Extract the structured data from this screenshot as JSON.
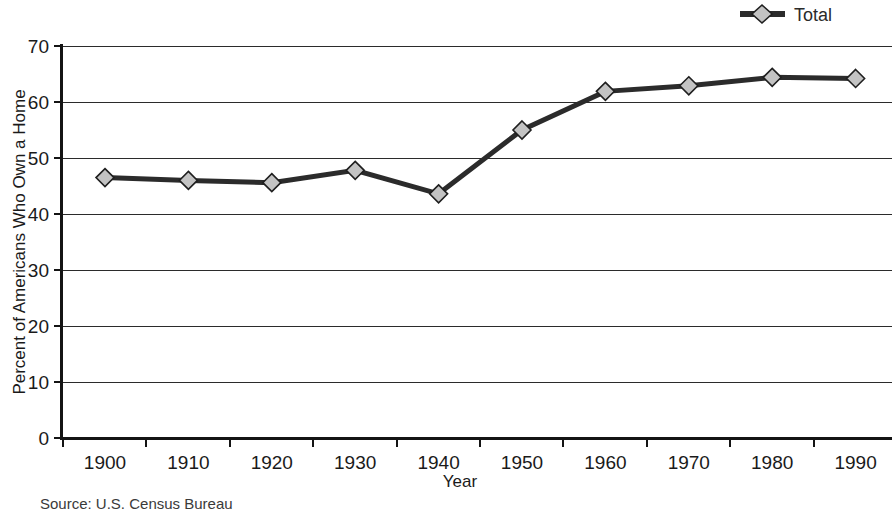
{
  "chart_data": {
    "type": "line",
    "title": "",
    "xlabel": "Year",
    "ylabel": "Percent of Americans Who Own a Home",
    "categories": [
      "1900",
      "1910",
      "1920",
      "1930",
      "1940",
      "1950",
      "1960",
      "1970",
      "1980",
      "1990"
    ],
    "x": [
      1900,
      1910,
      1920,
      1930,
      1940,
      1950,
      1960,
      1970,
      1980,
      1990
    ],
    "series": [
      {
        "name": "Total",
        "values": [
          46.5,
          46.0,
          45.6,
          47.8,
          43.6,
          55.0,
          61.9,
          62.9,
          64.4,
          64.2
        ],
        "color": "#2b2b2b",
        "marker": "diamond",
        "marker_fill": "#c3c3c3"
      }
    ],
    "ylim": [
      0,
      70
    ],
    "yticks": [
      0,
      10,
      20,
      30,
      40,
      50,
      60,
      70
    ],
    "ytick_labels": [
      "0",
      "10",
      "20",
      "30",
      "40",
      "50",
      "60",
      "70"
    ],
    "grid": true,
    "grid_axis": "y",
    "legend_position": "top-right",
    "legend_entries": [
      "Total"
    ],
    "source_note": "Source: U.S. Census Bureau"
  },
  "axes": {
    "y_title": "Percent of Americans Who Own a Home",
    "x_title": "Year"
  },
  "legend": {
    "total_label": "Total"
  },
  "footer": {
    "source": "Source: U.S. Census Bureau"
  },
  "colors": {
    "line": "#2b2b2b",
    "marker_fill": "#c3c3c3",
    "marker_stroke": "#1f1f1f",
    "grid": "#2b2b2b",
    "axis": "#141414",
    "text": "#1a1a1a",
    "background": "#ffffff"
  },
  "ticks": {
    "y": [
      "70",
      "60",
      "50",
      "40",
      "30",
      "20",
      "10",
      "0"
    ],
    "x": [
      "1900",
      "1910",
      "1920",
      "1930",
      "1940",
      "1950",
      "1960",
      "1970",
      "1980",
      "1990"
    ]
  }
}
